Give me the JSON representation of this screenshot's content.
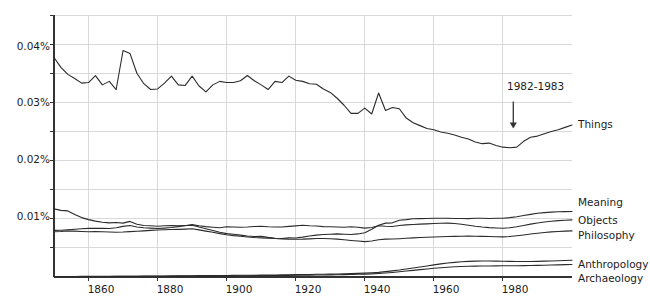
{
  "chart_data": {
    "type": "line",
    "title": "",
    "subtitle": "",
    "xlabel": "",
    "ylabel": "",
    "xlim": [
      1850,
      2000
    ],
    "ylim": [
      0,
      0.045
    ],
    "grid": true,
    "legend_position": "right-inline-labels",
    "y_tick_labels": [
      "0.04%",
      "0.03%",
      "0.02%",
      "0.01%"
    ],
    "y_tick_values": [
      0.04,
      0.03,
      0.02,
      0.01
    ],
    "y_minor_tick_values": [
      0.045,
      0.035,
      0.025,
      0.015,
      0.005
    ],
    "x_tick_labels": [
      "1860",
      "1880",
      "1900",
      "1920",
      "1940",
      "1960",
      "1980"
    ],
    "x_tick_values": [
      1860,
      1880,
      1900,
      1920,
      1940,
      1960,
      1980
    ],
    "units": "percent of corpus",
    "annotations": [
      {
        "text": "1982-1983",
        "x": 1983,
        "y": 0.0255,
        "arrow": "down",
        "label_y": 0.0305
      }
    ],
    "x": [
      1850,
      1852,
      1854,
      1856,
      1858,
      1860,
      1862,
      1864,
      1866,
      1868,
      1870,
      1872,
      1874,
      1876,
      1878,
      1880,
      1882,
      1884,
      1886,
      1888,
      1890,
      1892,
      1894,
      1896,
      1898,
      1900,
      1902,
      1904,
      1906,
      1908,
      1910,
      1912,
      1914,
      1916,
      1918,
      1920,
      1922,
      1924,
      1926,
      1928,
      1930,
      1932,
      1934,
      1936,
      1938,
      1940,
      1942,
      1944,
      1946,
      1948,
      1950,
      1952,
      1954,
      1956,
      1958,
      1960,
      1962,
      1964,
      1966,
      1968,
      1970,
      1972,
      1974,
      1976,
      1978,
      1980,
      1982,
      1984,
      1986,
      1988,
      1990,
      1992,
      1994,
      1996,
      1998,
      2000
    ],
    "series": [
      {
        "name": "Things",
        "color": "#2b2b2b",
        "values": [
          0.0377,
          0.036,
          0.0348,
          0.0341,
          0.0333,
          0.0334,
          0.0346,
          0.033,
          0.0336,
          0.0322,
          0.0389,
          0.0384,
          0.035,
          0.0332,
          0.0322,
          0.0323,
          0.0333,
          0.0345,
          0.033,
          0.0329,
          0.0345,
          0.0328,
          0.0318,
          0.033,
          0.0336,
          0.0334,
          0.0334,
          0.0337,
          0.0346,
          0.0337,
          0.033,
          0.0322,
          0.0336,
          0.0334,
          0.0345,
          0.0338,
          0.0336,
          0.0332,
          0.0331,
          0.0323,
          0.0317,
          0.0307,
          0.0295,
          0.0281,
          0.0281,
          0.029,
          0.028,
          0.0316,
          0.0286,
          0.0291,
          0.0289,
          0.0273,
          0.0265,
          0.026,
          0.0255,
          0.0253,
          0.0249,
          0.0247,
          0.0244,
          0.024,
          0.0237,
          0.0232,
          0.0229,
          0.023,
          0.0226,
          0.0223,
          0.0222,
          0.0223,
          0.0233,
          0.024,
          0.0242,
          0.0246,
          0.025,
          0.0253,
          0.0257,
          0.0261
        ]
      },
      {
        "name": "Meaning",
        "color": "#2b2b2b",
        "values": [
          0.0117,
          0.01145,
          0.01135,
          0.01075,
          0.0102,
          0.00985,
          0.0096,
          0.0094,
          0.0093,
          0.00935,
          0.00925,
          0.00955,
          0.00905,
          0.00885,
          0.0088,
          0.00872,
          0.0088,
          0.00885,
          0.0088,
          0.00885,
          0.00888,
          0.0086,
          0.0083,
          0.008,
          0.0077,
          0.00745,
          0.00735,
          0.0072,
          0.00705,
          0.00695,
          0.007,
          0.0068,
          0.00665,
          0.00662,
          0.00672,
          0.0067,
          0.00685,
          0.00705,
          0.0072,
          0.0073,
          0.00735,
          0.0074,
          0.00735,
          0.0073,
          0.0074,
          0.0076,
          0.0082,
          0.0089,
          0.00925,
          0.0093,
          0.00975,
          0.00985,
          0.01,
          0.01002,
          0.01005,
          0.0101,
          0.01008,
          0.0101,
          0.01005,
          0.01005,
          0.01002,
          0.0101,
          0.01008,
          0.01005,
          0.0101,
          0.01008,
          0.0102,
          0.01035,
          0.01055,
          0.01075,
          0.01095,
          0.01105,
          0.01115,
          0.0112,
          0.01122,
          0.01125
        ]
      },
      {
        "name": "Objects",
        "color": "#2b2b2b",
        "values": [
          0.008,
          0.00802,
          0.0081,
          0.0082,
          0.00828,
          0.00835,
          0.00838,
          0.00836,
          0.00832,
          0.00845,
          0.0087,
          0.00885,
          0.0086,
          0.00845,
          0.0084,
          0.00832,
          0.0084,
          0.0085,
          0.00865,
          0.0088,
          0.009,
          0.0088,
          0.00865,
          0.00855,
          0.00845,
          0.00862,
          0.00858,
          0.00855,
          0.0086,
          0.00868,
          0.00872,
          0.00862,
          0.00858,
          0.0086,
          0.0087,
          0.00878,
          0.00888,
          0.0088,
          0.00875,
          0.00865,
          0.00862,
          0.00858,
          0.00855,
          0.00862,
          0.00855,
          0.0084,
          0.0085,
          0.0088,
          0.00872,
          0.00868,
          0.00885,
          0.00895,
          0.00902,
          0.00908,
          0.00912,
          0.00918,
          0.00922,
          0.00925,
          0.00918,
          0.00905,
          0.0089,
          0.00872,
          0.00858,
          0.00848,
          0.00842,
          0.00838,
          0.00845,
          0.00862,
          0.00885,
          0.00908,
          0.00928,
          0.00945,
          0.00958,
          0.00968,
          0.00975,
          0.00982
        ]
      },
      {
        "name": "Philosophy",
        "color": "#2b2b2b",
        "values": [
          0.00778,
          0.00782,
          0.0079,
          0.00788,
          0.00782,
          0.00778,
          0.00782,
          0.00776,
          0.00772,
          0.00768,
          0.00772,
          0.0078,
          0.00785,
          0.00792,
          0.008,
          0.00808,
          0.00812,
          0.00815,
          0.00818,
          0.00822,
          0.00828,
          0.0081,
          0.00788,
          0.00768,
          0.00745,
          0.00725,
          0.0071,
          0.007,
          0.00688,
          0.00678,
          0.00672,
          0.00668,
          0.0066,
          0.00655,
          0.0065,
          0.00648,
          0.0065,
          0.00655,
          0.0066,
          0.00662,
          0.00658,
          0.0065,
          0.0064,
          0.00628,
          0.00618,
          0.00608,
          0.00618,
          0.0064,
          0.0065,
          0.00652,
          0.00658,
          0.00665,
          0.00672,
          0.00678,
          0.00682,
          0.00688,
          0.00692,
          0.00695,
          0.00698,
          0.007,
          0.00702,
          0.007,
          0.00698,
          0.00695,
          0.00692,
          0.0069,
          0.00695,
          0.00708,
          0.00722,
          0.00738,
          0.00752,
          0.00765,
          0.00775,
          0.00782,
          0.00788,
          0.00792
        ]
      },
      {
        "name": "Anthropology",
        "color": "#2b2b2b",
        "values": [
          8e-05,
          8e-05,
          9e-05,
          9e-05,
          0.0001,
          0.0001,
          0.00011,
          0.00011,
          0.00012,
          0.00012,
          0.00013,
          0.00014,
          0.00014,
          0.00015,
          0.00016,
          0.00017,
          0.00018,
          0.00019,
          0.0002,
          0.00021,
          0.00022,
          0.00023,
          0.00024,
          0.00025,
          0.00026,
          0.00027,
          0.00028,
          0.00029,
          0.0003,
          0.00031,
          0.00032,
          0.00034,
          0.00035,
          0.00036,
          0.00038,
          0.0004,
          0.00042,
          0.00044,
          0.00046,
          0.00048,
          0.0005,
          0.00052,
          0.00055,
          0.00058,
          0.00062,
          0.00066,
          0.00072,
          0.0008,
          0.00092,
          0.00105,
          0.0012,
          0.00138,
          0.00155,
          0.00172,
          0.0019,
          0.00208,
          0.00225,
          0.0024,
          0.00252,
          0.00262,
          0.00268,
          0.00272,
          0.00274,
          0.00274,
          0.00272,
          0.0027,
          0.00268,
          0.00266,
          0.00265,
          0.00266,
          0.00268,
          0.00272,
          0.00276,
          0.0028,
          0.00284,
          0.00288
        ]
      },
      {
        "name": "Archaeology",
        "color": "#2b2b2b",
        "values": [
          6e-05,
          6e-05,
          7e-05,
          7e-05,
          8e-05,
          8e-05,
          8e-05,
          9e-05,
          9e-05,
          0.0001,
          0.0001,
          0.00011,
          0.00011,
          0.00012,
          0.00012,
          0.00013,
          0.00013,
          0.00014,
          0.00015,
          0.00015,
          0.00016,
          0.00017,
          0.00018,
          0.00018,
          0.00019,
          0.0002,
          0.00021,
          0.00022,
          0.00022,
          0.00023,
          0.00024,
          0.00025,
          0.00026,
          0.00027,
          0.00028,
          0.00029,
          0.00031,
          0.00032,
          0.00034,
          0.00035,
          0.00037,
          0.00039,
          0.00041,
          0.00043,
          0.00046,
          0.00049,
          0.00054,
          0.0006,
          0.00068,
          0.00078,
          0.0009,
          0.00102,
          0.00114,
          0.00126,
          0.00138,
          0.0015,
          0.0016,
          0.00168,
          0.00175,
          0.0018,
          0.00184,
          0.00187,
          0.00189,
          0.0019,
          0.00191,
          0.00192,
          0.00193,
          0.00194,
          0.00196,
          0.00198,
          0.002,
          0.00203,
          0.00206,
          0.00209,
          0.00212,
          0.00215
        ]
      }
    ]
  },
  "style": {
    "line_color": "#2b2b2b",
    "grid_color": "#d9d9d9",
    "axis_color": "#333333",
    "background": "#ffffff",
    "text_color": "#1c1c1c"
  }
}
